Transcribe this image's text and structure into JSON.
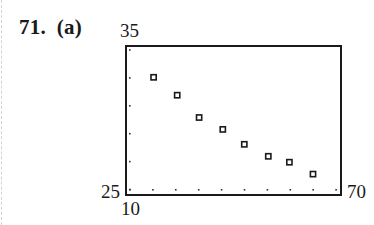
{
  "problem": {
    "number": "71.",
    "part": "(a)",
    "label": "71.  (a)"
  },
  "window_labels": {
    "ymax": "35",
    "ymin": "25",
    "xmin": "10",
    "xmax": "70"
  },
  "chart_data": {
    "type": "scatter",
    "title": "",
    "xlabel": "",
    "ylabel": "",
    "xlim": [
      10,
      70
    ],
    "ylim": [
      25,
      35
    ],
    "grid": false,
    "legend": null,
    "marker": "hollow-square",
    "tick_marks": "dots",
    "x_tick_count": 10,
    "y_tick_count": 6,
    "x": [
      17.7,
      24.3,
      30.4,
      37.0,
      43.0,
      49.7,
      55.6,
      62.2
    ],
    "y": [
      32.9,
      31.7,
      30.2,
      29.4,
      28.4,
      27.6,
      27.2,
      26.4
    ],
    "annotations": [
      "35",
      "25",
      "10",
      "70"
    ]
  },
  "colors": {
    "frame": "#1a1a1a",
    "marker": "#1a1a1a",
    "tick_dots": "#333333",
    "text": "#1a1a1a"
  }
}
